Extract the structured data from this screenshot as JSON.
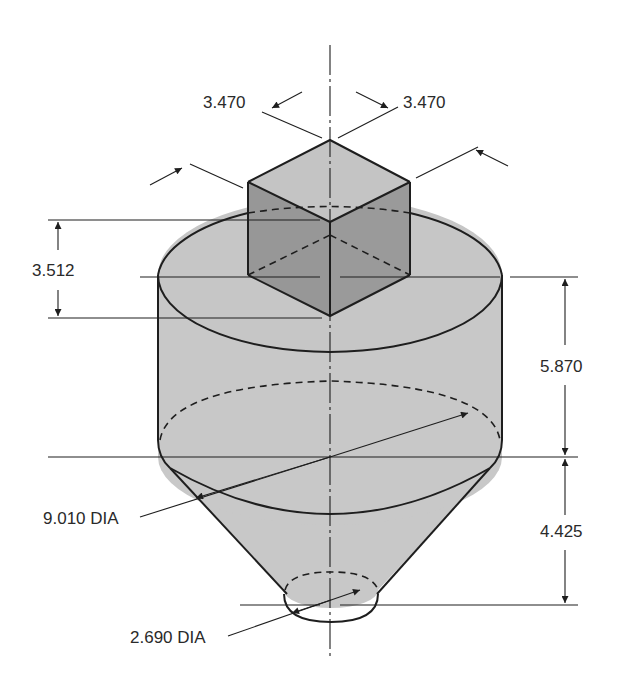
{
  "figure": {
    "type": "isometric-technical-drawing",
    "colors": {
      "background": "#ffffff",
      "light_fill": "#c8c8c8",
      "dark_fill": "#969696",
      "top_fill": "#c4c4c4",
      "line": "#1e1e1e",
      "text": "#2a2a2a"
    }
  },
  "dimensions": {
    "cube_left_edge": "3.470",
    "cube_right_edge": "3.470",
    "cube_height": "3.512",
    "cylinder_height": "5.870",
    "cone_height": "4.425",
    "cylinder_diameter": "9.010 DIA",
    "cone_bottom_diameter": "2.690 DIA"
  }
}
